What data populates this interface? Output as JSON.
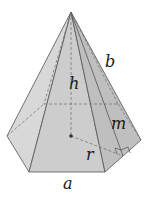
{
  "diagram": {
    "labels": {
      "height": "h",
      "lateral_edge": "b",
      "slant_height": "m",
      "apothem": "r",
      "base_edge": "a"
    },
    "colors": {
      "face_light": "#dcdcdc",
      "face_mid": "#cfcfcf",
      "face_dark": "#bdbdbd",
      "edge": "#555555",
      "hidden_edge": "#777777",
      "background": "#ffffff"
    }
  }
}
